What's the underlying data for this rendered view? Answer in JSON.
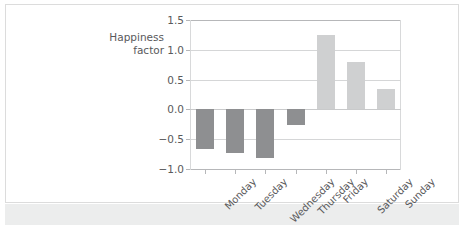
{
  "figure": {
    "background_color": "#ffffff",
    "frame_color": "#dcdcdc",
    "bottom_band_color": "#eceded"
  },
  "chart_data": {
    "type": "bar",
    "title": "",
    "subtitle": "",
    "xlabel": "",
    "ylabel": "Happiness\nfactor",
    "categories": [
      "Monday",
      "Tuesday",
      "Wednesday",
      "Thursday",
      "Friday",
      "Saturday",
      "Sunday"
    ],
    "values": [
      -0.67,
      -0.74,
      -0.81,
      -0.27,
      1.25,
      0.79,
      0.35
    ],
    "ylim": [
      -1.0,
      1.5
    ],
    "yticks": [
      1.5,
      1.0,
      0.5,
      0.0,
      -0.5,
      -1.0
    ],
    "ytick_labels": [
      "1.5",
      "1.0",
      "0.5",
      "0.0",
      "−0.5",
      "−1.0"
    ],
    "grid": true,
    "grid_axis": "y",
    "legend": false,
    "legend_position": "none",
    "xtick_rotation": -45,
    "bar_colors": {
      "negative": "#8e8f91",
      "positive": "#cfd0d1"
    },
    "series": [
      {
        "name": "Happiness factor",
        "points": [
          {
            "category": "Monday",
            "value": -0.67,
            "sign": "negative"
          },
          {
            "category": "Tuesday",
            "value": -0.74,
            "sign": "negative"
          },
          {
            "category": "Wednesday",
            "value": -0.81,
            "sign": "negative"
          },
          {
            "category": "Thursday",
            "value": -0.27,
            "sign": "negative"
          },
          {
            "category": "Friday",
            "value": 1.25,
            "sign": "positive"
          },
          {
            "category": "Saturday",
            "value": 0.79,
            "sign": "positive"
          },
          {
            "category": "Sunday",
            "value": 0.35,
            "sign": "positive"
          }
        ]
      }
    ]
  }
}
